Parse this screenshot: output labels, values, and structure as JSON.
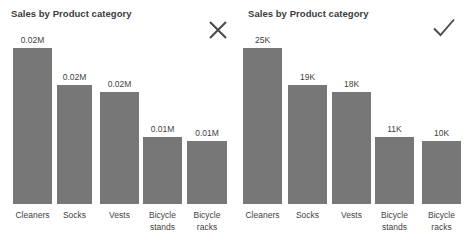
{
  "panels": [
    {
      "name": "left-panel",
      "title": "Sales by Product category",
      "verdict": "cross-icon",
      "verdict_label": "X"
    },
    {
      "name": "right-panel",
      "title": "Sales by Product category",
      "verdict": "check-icon",
      "verdict_label": "Check"
    }
  ],
  "colors": {
    "bar": "#777777",
    "title_text": "#3b3b3b",
    "label_text": "#3f3f3f",
    "background": "#ffffff"
  },
  "chart_data": [
    {
      "type": "bar",
      "title": "Sales by Product category",
      "xlabel": "",
      "ylabel": "",
      "grid": false,
      "legend": "none",
      "axis_visible": false,
      "value_format": "0.00M",
      "categories": [
        "Cleaners",
        "Socks",
        "Vests",
        "Bicycle stands",
        "Bicycle racks"
      ],
      "values": [
        0.02,
        0.02,
        0.02,
        0.01,
        0.01
      ],
      "data_labels": [
        "0.02M",
        "0.02M",
        "0.02M",
        "0.01M",
        "0.01M"
      ],
      "bar_pixel_heights": [
        156,
        119,
        112,
        67,
        63
      ],
      "ylim": [
        0,
        0.025
      ]
    },
    {
      "type": "bar",
      "title": "Sales by Product category",
      "xlabel": "",
      "ylabel": "",
      "grid": false,
      "legend": "none",
      "axis_visible": false,
      "value_format": "0K",
      "categories": [
        "Cleaners",
        "Socks",
        "Vests",
        "Bicycle stands",
        "Bicycle racks"
      ],
      "values": [
        25000,
        19000,
        18000,
        11000,
        10000
      ],
      "data_labels": [
        "25K",
        "19K",
        "18K",
        "11K",
        "10K"
      ],
      "bar_pixel_heights": [
        156,
        119,
        112,
        67,
        63
      ],
      "ylim": [
        0,
        25000
      ]
    }
  ],
  "left_chart": {
    "title": "Sales by Product category",
    "bars": [
      {
        "label": "Cleaners",
        "value_text": "0.02M",
        "x": 13,
        "width": 39,
        "height": 156
      },
      {
        "label": "Socks",
        "value_text": "0.02M",
        "x": 57,
        "width": 35,
        "height": 119
      },
      {
        "label": "Vests",
        "value_text": "0.02M",
        "x": 100,
        "width": 39,
        "height": 112
      },
      {
        "label": "Bicycle\nstands",
        "value_text": "0.01M",
        "x": 143,
        "width": 39,
        "height": 67
      },
      {
        "label": "Bicycle\nracks",
        "value_text": "0.01M",
        "x": 187,
        "width": 40,
        "height": 63
      }
    ]
  },
  "right_chart": {
    "title": "Sales by Product category",
    "bars": [
      {
        "label": "Cleaners",
        "value_text": "25K",
        "x": 6,
        "width": 39,
        "height": 156
      },
      {
        "label": "Socks",
        "value_text": "19K",
        "x": 51,
        "width": 39,
        "height": 119
      },
      {
        "label": "Vests",
        "value_text": "18K",
        "x": 95,
        "width": 39,
        "height": 112
      },
      {
        "label": "Bicycle\nstands",
        "value_text": "11K",
        "x": 138,
        "width": 39,
        "height": 67
      },
      {
        "label": "Bicycle\nracks",
        "value_text": "10K",
        "x": 185,
        "width": 39,
        "height": 63
      }
    ]
  }
}
